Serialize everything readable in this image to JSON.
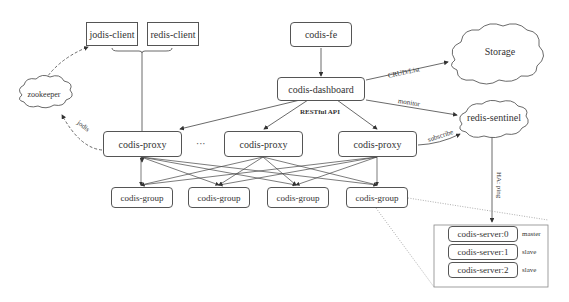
{
  "diagram": {
    "clients": [
      {
        "id": "jodis-client",
        "label": "jodis-client"
      },
      {
        "id": "redis-client",
        "label": "redis-client"
      }
    ],
    "fe": {
      "label": "codis-fe"
    },
    "dashboard": {
      "label": "codis-dashboard"
    },
    "storage": {
      "label": "Storage"
    },
    "sentinel": {
      "label": "redis-sentinel"
    },
    "zookeeper": {
      "label": "zookeeper"
    },
    "proxies": [
      {
        "label": "codis-proxy"
      },
      {
        "label": "codis-proxy"
      },
      {
        "label": "codis-proxy"
      }
    ],
    "proxy_ellipsis": "···",
    "groups": [
      {
        "label": "codis-group"
      },
      {
        "label": "codis-group"
      },
      {
        "label": "codis-group"
      },
      {
        "label": "codis-group"
      }
    ],
    "servers": [
      {
        "label": "codis-server:0",
        "role": "master"
      },
      {
        "label": "codis-server:1",
        "role": "slave"
      },
      {
        "label": "codis-server:2",
        "role": "slave"
      }
    ],
    "edge_labels": {
      "crud": "CRUD/List",
      "monitor": "monitor",
      "restful": "RESTful API",
      "subscribe": "subscribe",
      "ha": "HA: ping",
      "jodis": "jodis"
    },
    "colors": {
      "line": "#444444",
      "border": "#555555",
      "text": "#333333",
      "background": "#ffffff"
    }
  }
}
